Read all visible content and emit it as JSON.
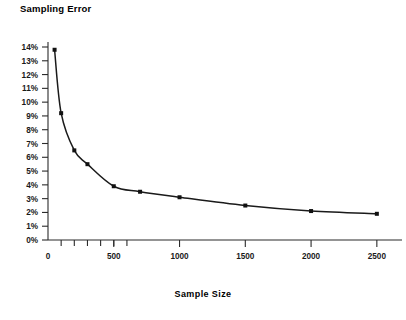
{
  "chart_data": {
    "type": "line",
    "title": "Sampling Error",
    "xlabel": "Sample Size",
    "ylabel": "",
    "x": [
      50,
      100,
      200,
      300,
      500,
      700,
      1000,
      1500,
      2000,
      2500
    ],
    "values": [
      13.8,
      9.2,
      6.5,
      5.5,
      3.9,
      3.5,
      3.1,
      2.5,
      2.1,
      1.9
    ],
    "series": [
      {
        "name": "Sampling Error",
        "values": [
          13.8,
          9.2,
          6.5,
          5.5,
          3.9,
          3.5,
          3.1,
          2.5,
          2.1,
          1.9
        ]
      }
    ],
    "xlim": [
      0,
      2600
    ],
    "ylim": [
      0,
      14
    ],
    "grid": false,
    "legend": null,
    "marker": "square",
    "line_color": "#1a1a1a",
    "y_tick_labels": [
      "0%",
      "1%",
      "2%",
      "3%",
      "4%",
      "5%",
      "6%",
      "7%",
      "8%",
      "9%",
      "10%",
      "11%",
      "12%",
      "13%",
      "14%"
    ],
    "y_tick_values": [
      0,
      1,
      2,
      3,
      4,
      5,
      6,
      7,
      8,
      9,
      10,
      11,
      12,
      13,
      14
    ],
    "x_tick_labels": [
      "0",
      "500",
      "1000",
      "1500",
      "2000",
      "2500"
    ],
    "x_tick_values": [
      0,
      500,
      1000,
      1500,
      2000,
      2500
    ],
    "x_minor_ticks": [
      100,
      200,
      300,
      400,
      500,
      600
    ]
  }
}
